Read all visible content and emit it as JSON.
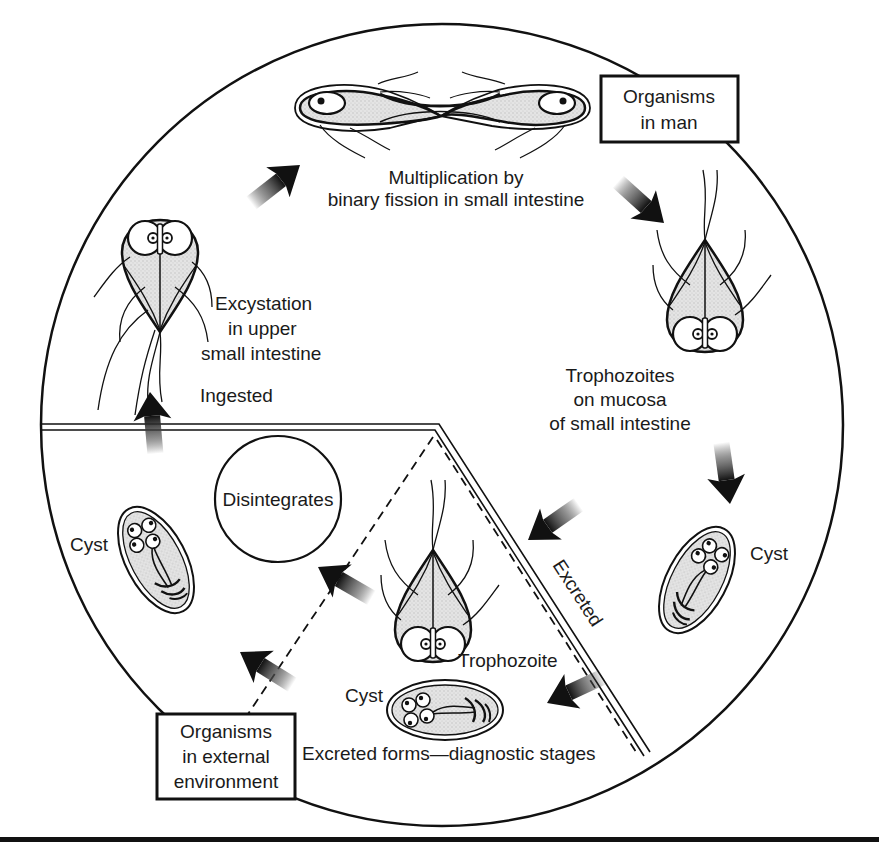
{
  "diagram": {
    "colors": {
      "ink": "#1a1a1a",
      "shade": "#d4d4d4",
      "background": "#ffffff"
    },
    "boxes": {
      "organisms_in_man": [
        "Organisms",
        "in man"
      ],
      "organisms_external": [
        "Organisms",
        "in external",
        "environment"
      ]
    },
    "labels": {
      "multiplication": [
        "Multiplication by",
        "binary fission in small intestine"
      ],
      "excystation": [
        "Excystation",
        "in upper",
        "small intestine"
      ],
      "ingested": "Ingested",
      "trophozoites_mucosa": [
        "Trophozoites",
        "on mucosa",
        "of small intestine"
      ],
      "disintegrates": "Disintegrates",
      "cyst_left": "Cyst",
      "cyst_right": "Cyst",
      "cyst_bottom": "Cyst",
      "trophozoite": "Trophozoite",
      "excreted": "Excreted",
      "excreted_forms": "Excreted forms—diagnostic stages"
    },
    "regions": [
      {
        "name": "Organisms in man",
        "area": "upper portion of circle"
      },
      {
        "name": "Organisms in external environment",
        "area": "lower-left portion of circle"
      }
    ],
    "icons": {
      "flow_arrow": "gradient-arrow",
      "trophozoite": "pear-shaped-flagellate",
      "cyst": "oval-cyst-with-nuclei"
    }
  }
}
